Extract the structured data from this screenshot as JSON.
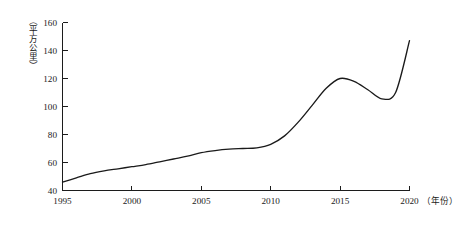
{
  "chart_data": {
    "type": "line",
    "title": "",
    "xlabel": "（年份）",
    "ylabel": "（平方公里）",
    "xlim": [
      1995,
      2021.5
    ],
    "ylim": [
      40,
      160
    ],
    "grid": false,
    "legend": "none",
    "x_ticks": [
      "1995",
      "2000",
      "2005",
      "2010",
      "2015",
      "2020"
    ],
    "x_tick_values": [
      1995,
      2000,
      2005,
      2010,
      2015,
      2020
    ],
    "y_ticks": [
      "40",
      "60",
      "80",
      "100",
      "120",
      "140",
      "160"
    ],
    "y_tick_values": [
      40,
      60,
      80,
      100,
      120,
      140,
      160
    ],
    "series": [
      {
        "name": "建成区面积",
        "x": [
          1995,
          1996,
          1997,
          1998,
          1999,
          2000,
          2001,
          2002,
          2003,
          2004,
          2005,
          2006,
          2007,
          2008,
          2009,
          2010,
          2011,
          2012,
          2013,
          2014,
          2015,
          2016,
          2017,
          2018,
          2019,
          2020
        ],
        "values": [
          46,
          49,
          52,
          54,
          55.5,
          57,
          58.5,
          60.5,
          62.5,
          64.5,
          67,
          68.5,
          69.5,
          70,
          70.5,
          73,
          79,
          89,
          101,
          113,
          120,
          118,
          112,
          105.5,
          110,
          147
        ]
      }
    ],
    "annotations": []
  },
  "axis": {
    "y_unit_label": "（平方公里）",
    "x_unit_label": "（年份）"
  }
}
